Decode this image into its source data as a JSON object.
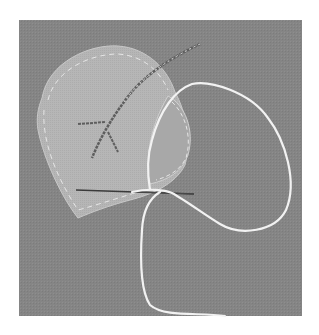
{
  "image": {
    "subject": "fabric leaf appliqué stitched onto linen with needle and thread",
    "colors": {
      "background": "#ffffff",
      "linen": "#858585",
      "leaf": "#b4b4b4",
      "leaf_fold": "#a6a6a6",
      "thread": "#f2f2f2",
      "vein": "#5a5a5a",
      "needle": "#3a3a3a"
    }
  }
}
